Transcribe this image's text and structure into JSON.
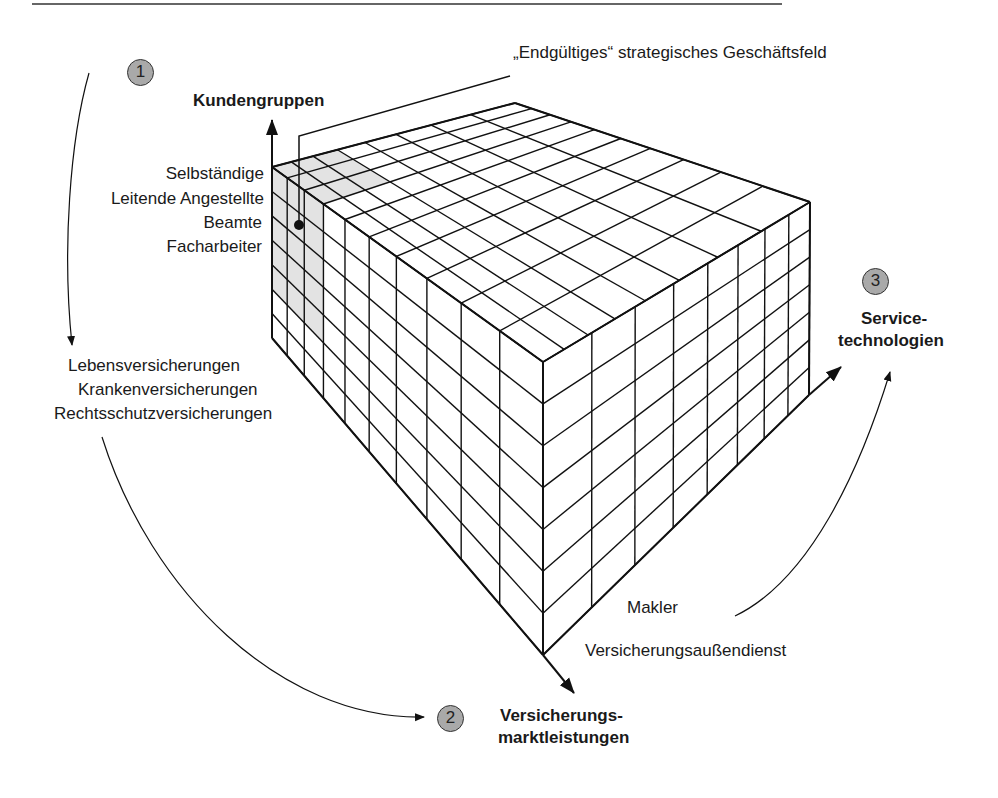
{
  "colors": {
    "line": "#111111",
    "shade": "#e3e3e3",
    "badge": "#a9a9a9"
  },
  "title_callout": "„Endgültiges“ strategisches Geschäftsfeld",
  "axes": {
    "customers": {
      "step": "1",
      "label": "Kundengruppen",
      "items": [
        "Selbständige",
        "Leitende Angestellte",
        "Beamte",
        "Facharbeiter"
      ]
    },
    "products": {
      "step": "2",
      "label_line1": "Versicherungs-",
      "label_line2": "marktleistungen",
      "items": [
        "Lebensversicherungen",
        "Krankenversicherungen",
        "Rechtsschutzversicherungen"
      ]
    },
    "technologies": {
      "step": "3",
      "label_line1": "Service-",
      "label_line2": "technologien",
      "items": [
        "Makler",
        "Versicherungsaußendienst"
      ]
    }
  },
  "cube": {
    "rows": 7,
    "left_columns": 10,
    "right_columns": 8
  }
}
